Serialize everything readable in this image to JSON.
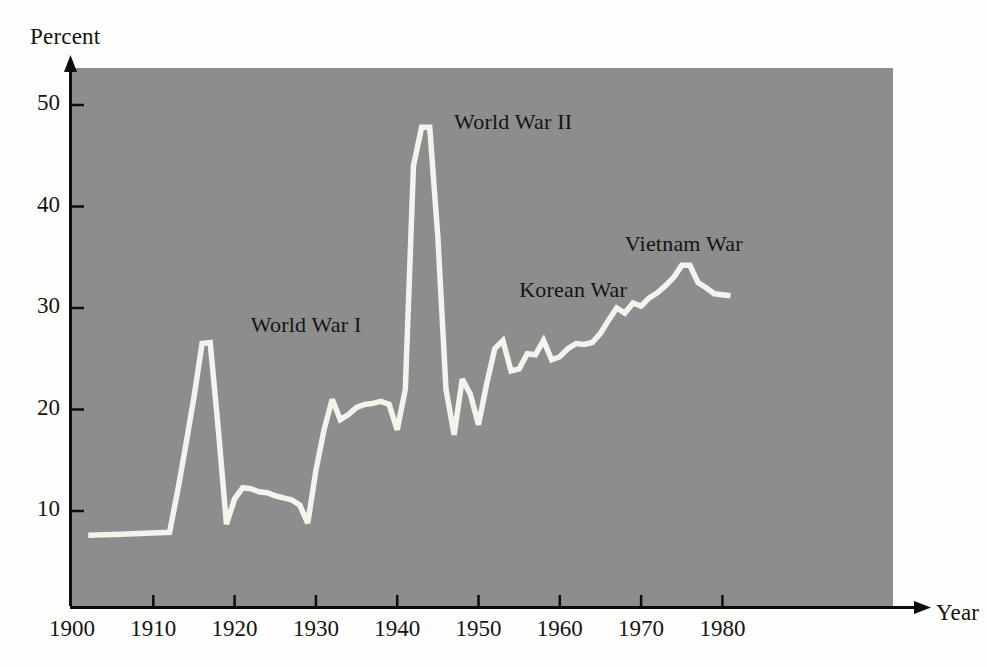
{
  "chart_data": {
    "type": "line",
    "title": "",
    "xlabel": "Year",
    "ylabel": "Percent",
    "xlim": [
      1900,
      1982
    ],
    "ylim": [
      0,
      54
    ],
    "xticks": [
      1900,
      1910,
      1920,
      1930,
      1940,
      1950,
      1960,
      1970,
      1980
    ],
    "yticks": [
      10,
      20,
      30,
      40,
      50
    ],
    "grid": false,
    "legend": "none",
    "series": [
      {
        "name": "Percent",
        "x": [
          1902,
          1906,
          1912,
          1913,
          1914,
          1915,
          1916,
          1917,
          1918,
          1919,
          1920,
          1921,
          1922,
          1923,
          1924,
          1925,
          1926,
          1927,
          1928,
          1929,
          1930,
          1931,
          1932,
          1933,
          1934,
          1935,
          1936,
          1937,
          1938,
          1939,
          1940,
          1941,
          1942,
          1943,
          1944,
          1945,
          1946,
          1947,
          1948,
          1949,
          1950,
          1951,
          1952,
          1953,
          1954,
          1955,
          1956,
          1957,
          1958,
          1959,
          1960,
          1961,
          1962,
          1963,
          1964,
          1965,
          1966,
          1967,
          1968,
          1969,
          1970,
          1971,
          1972,
          1973,
          1974,
          1975,
          1976,
          1977,
          1978,
          1979,
          1981
        ],
        "values": [
          7.6,
          7.7,
          7.9,
          12.0,
          16.5,
          21.2,
          26.5,
          26.6,
          18.0,
          8.7,
          11.2,
          12.3,
          12.2,
          11.9,
          11.8,
          11.5,
          11.3,
          11.1,
          10.6,
          8.8,
          14.0,
          18.0,
          21.0,
          19.0,
          19.5,
          20.2,
          20.5,
          20.6,
          20.8,
          20.5,
          18.0,
          22.0,
          44.0,
          47.8,
          47.8,
          37.0,
          22.0,
          17.5,
          23.0,
          21.5,
          18.5,
          22.5,
          26.0,
          26.8,
          23.8,
          24.0,
          25.5,
          25.4,
          26.8,
          24.9,
          25.2,
          26.0,
          26.5,
          26.4,
          26.6,
          27.5,
          28.8,
          30.0,
          29.5,
          30.5,
          30.2,
          31.0,
          31.5,
          32.2,
          33.0,
          34.2,
          34.2,
          32.5,
          32.0,
          31.4,
          31.2
        ]
      }
    ],
    "annotations": [
      {
        "text": "World War I",
        "x": 1922,
        "y": 28.5
      },
      {
        "text": "World War II",
        "x": 1947,
        "y": 48.5
      },
      {
        "text": "Korean War",
        "x": 1955,
        "y": 32.0
      },
      {
        "text": "Vietnam War",
        "x": 1968,
        "y": 36.5
      }
    ],
    "colors": {
      "plot_background": "#8d8d8d",
      "page_background": "#fdfdfb",
      "line": "#f4f3ec",
      "axis": "#0d0d0d",
      "text": "#141414"
    }
  },
  "labels": {
    "y_axis_title": "Percent",
    "x_axis_title": "Year",
    "y_ticks": [
      "10",
      "20",
      "30",
      "40",
      "50"
    ],
    "x_ticks": [
      "1900",
      "1910",
      "1920",
      "1930",
      "1940",
      "1950",
      "1960",
      "1970",
      "1980"
    ],
    "annotation_world_war_1": "World War I",
    "annotation_world_war_2": "World War II",
    "annotation_korean_war": "Korean War",
    "annotation_vietnam_war": "Vietnam War"
  }
}
